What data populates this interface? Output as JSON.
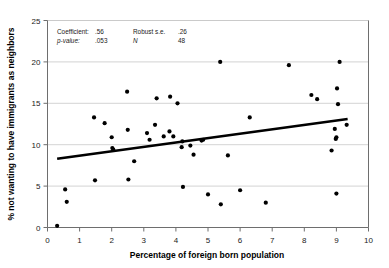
{
  "chart_data": {
    "type": "scatter",
    "title": "",
    "xlabel": "Percentage of foreign born population",
    "ylabel": "% not wanting to have immigrants as neighbors",
    "xlim": [
      0,
      10
    ],
    "ylim": [
      0,
      25
    ],
    "xticks": [
      "0",
      "1",
      "2",
      "3",
      "4",
      "5",
      "6",
      "7",
      "8",
      "9",
      "10"
    ],
    "yticks": [
      "0",
      "5",
      "10",
      "15",
      "20",
      "25"
    ],
    "grid": "horizontal",
    "legend": "none",
    "point_color": "#000000",
    "line_color": "#000000",
    "grid_color": "#c8c8c8",
    "axis_color": "#808080",
    "points": [
      [
        0.3,
        0.2
      ],
      [
        0.55,
        4.6
      ],
      [
        0.6,
        3.1
      ],
      [
        1.45,
        13.3
      ],
      [
        1.48,
        5.7
      ],
      [
        1.78,
        12.6
      ],
      [
        2.0,
        10.9
      ],
      [
        2.02,
        9.6
      ],
      [
        2.05,
        9.4
      ],
      [
        2.48,
        16.4
      ],
      [
        2.5,
        11.8
      ],
      [
        2.52,
        5.8
      ],
      [
        2.7,
        8.0
      ],
      [
        3.1,
        11.4
      ],
      [
        3.18,
        10.6
      ],
      [
        3.35,
        12.4
      ],
      [
        3.4,
        15.6
      ],
      [
        3.62,
        11.0
      ],
      [
        3.8,
        11.6
      ],
      [
        3.82,
        15.8
      ],
      [
        3.92,
        11.0
      ],
      [
        4.05,
        15.0
      ],
      [
        4.18,
        9.7
      ],
      [
        4.2,
        10.4
      ],
      [
        4.22,
        4.9
      ],
      [
        4.45,
        9.9
      ],
      [
        4.55,
        8.8
      ],
      [
        4.8,
        10.5
      ],
      [
        4.85,
        10.6
      ],
      [
        5.0,
        4.0
      ],
      [
        5.38,
        20.0
      ],
      [
        5.4,
        2.8
      ],
      [
        5.62,
        8.7
      ],
      [
        6.0,
        4.5
      ],
      [
        6.3,
        13.3
      ],
      [
        6.8,
        3.0
      ],
      [
        7.52,
        19.6
      ],
      [
        8.22,
        16.0
      ],
      [
        8.4,
        15.5
      ],
      [
        8.85,
        9.3
      ],
      [
        8.95,
        11.9
      ],
      [
        8.98,
        10.7
      ],
      [
        9.0,
        10.9
      ],
      [
        9.0,
        4.1
      ],
      [
        9.02,
        16.8
      ],
      [
        9.05,
        14.9
      ],
      [
        9.1,
        20.0
      ],
      [
        9.32,
        12.4
      ]
    ],
    "trendline": {
      "x_start": 0.3,
      "y_start": 8.3,
      "x_end": 9.35,
      "y_end": 13.1
    }
  },
  "annotation": {
    "coefficient_label": "Coefficient:",
    "coefficient_value": ".56",
    "robust_se_label": "Robust s.e.",
    "robust_se_value": ".26",
    "pvalue_label": "p-value:",
    "pvalue_value": ".053",
    "n_label": "N",
    "n_value": "48"
  }
}
